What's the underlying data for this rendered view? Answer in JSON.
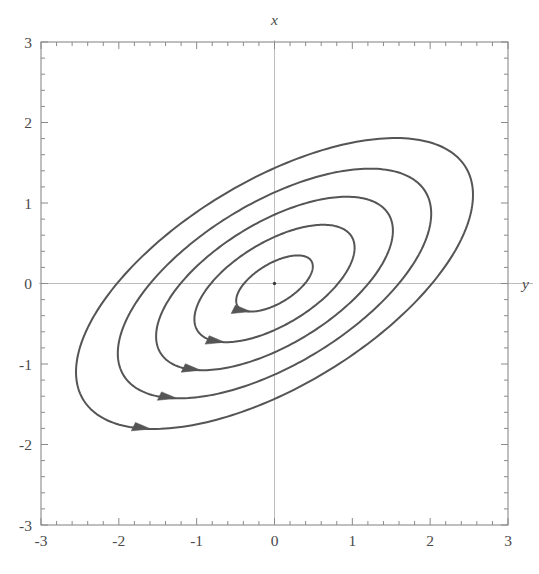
{
  "figure": {
    "kind": "phase-portrait",
    "width": 539,
    "height": 574,
    "background": "#ffffff",
    "curve_color": "#555555",
    "frame_color": "#8a8a8a",
    "axis_line_color": "#bdbdbd",
    "tick_color": "#8a8a8a",
    "label_color": "#4a4a4a",
    "origin_dot_color": "#3a3a3a"
  },
  "axes": {
    "vertical_name": "x",
    "horizontal_name": "y",
    "x_label_position": "top-center",
    "y_label_position": "right-middle",
    "xlim": [
      -3,
      3
    ],
    "ylim": [
      -3,
      3
    ],
    "major_tick_step": 1,
    "minor_ticks_per_major": 5,
    "grid": false,
    "frame": true
  },
  "tick_labels": {
    "horizontal": [
      "-3",
      "-2",
      "-1",
      "0",
      "1",
      "2",
      "3"
    ],
    "vertical": [
      "3",
      "2",
      "1",
      "0",
      "-1",
      "-2",
      "-3"
    ]
  },
  "chart_data": {
    "type": "line",
    "title": "",
    "xlabel": "y",
    "ylabel": "x",
    "xlim": [
      -3,
      3
    ],
    "ylim": [
      -3,
      3
    ],
    "grid": false,
    "legend": "none",
    "center": [
      0,
      0
    ],
    "rotation_deg": 30,
    "axis_ratio": 0.45,
    "series": [
      {
        "name": "orbit-1",
        "semi_major": 0.55,
        "semi_minor": 0.248,
        "rotation_deg": 30,
        "arrow_at_deg": 148
      },
      {
        "name": "orbit-2",
        "semi_major": 1.15,
        "semi_minor": 0.518,
        "rotation_deg": 30,
        "arrow_at_deg": 148
      },
      {
        "name": "orbit-3",
        "semi_major": 1.7,
        "semi_minor": 0.765,
        "rotation_deg": 30,
        "arrow_at_deg": 148
      },
      {
        "name": "orbit-4",
        "semi_major": 2.25,
        "semi_minor": 1.013,
        "rotation_deg": 30,
        "arrow_at_deg": 148
      },
      {
        "name": "orbit-5",
        "semi_major": 2.85,
        "semi_minor": 1.283,
        "rotation_deg": 30,
        "arrow_at_deg": 148
      }
    ],
    "annotations": [
      {
        "name": "origin-point",
        "x": 0,
        "y": 0,
        "marker": "dot"
      }
    ]
  }
}
